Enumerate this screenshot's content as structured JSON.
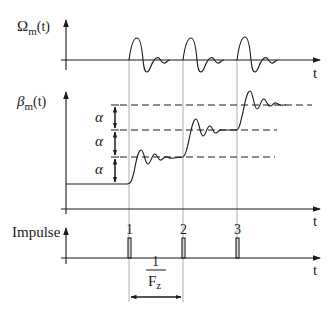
{
  "diagram": {
    "top_plot": {
      "ylabel_main": "Ω",
      "ylabel_sub": "m",
      "ylabel_arg": "(t)",
      "xlabel": "t"
    },
    "middle_plot": {
      "ylabel_main": "β",
      "ylabel_sub": "m",
      "ylabel_arg": "(t)",
      "xlabel": "t",
      "step_labels": [
        "α",
        "α",
        "α"
      ]
    },
    "bottom_plot": {
      "ylabel": "Impulse",
      "xlabel": "t",
      "impulse_labels": [
        "1",
        "2",
        "3"
      ],
      "period_numerator": "1",
      "period_denominator_main": "F",
      "period_denominator_sub": "z"
    },
    "colors": {
      "line": "#1a1a1a",
      "guide": "#9a9a9a"
    }
  }
}
